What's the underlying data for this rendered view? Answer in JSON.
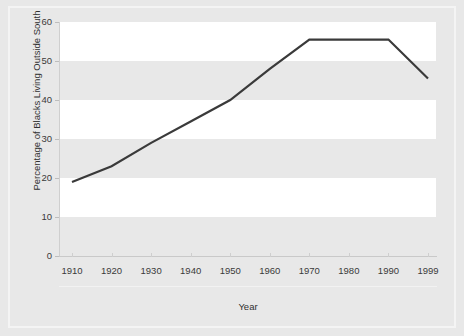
{
  "chart_data": {
    "type": "line",
    "title": "",
    "xlabel": "Year",
    "ylabel": "Percentage of Blacks Living Outside South",
    "categories": [
      "1910",
      "1920",
      "1930",
      "1940",
      "1950",
      "1960",
      "1970",
      "1980",
      "1990",
      "1999"
    ],
    "x": [
      1910,
      1920,
      1930,
      1940,
      1950,
      1960,
      1970,
      1980,
      1990,
      1999
    ],
    "values": [
      19,
      23,
      29,
      34.5,
      40,
      48,
      55.5,
      55.5,
      55.5,
      45.5
    ],
    "series": [
      {
        "name": "Percentage of Blacks Living Outside South",
        "values": [
          19,
          23,
          29,
          34.5,
          40,
          48,
          55.5,
          55.5,
          55.5,
          45.5
        ]
      }
    ],
    "ylim": [
      0,
      60
    ],
    "yticks": [
      0,
      10,
      20,
      30,
      40,
      50,
      60
    ],
    "ytick_labels": [
      "0",
      "10",
      "20",
      "30",
      "40",
      "50",
      "60"
    ],
    "xtick_labels": [
      "1910",
      "1920",
      "1930",
      "1940",
      "1950",
      "1960",
      "1970",
      "1980",
      "1990",
      "1999"
    ],
    "grid": false,
    "banded_background": true,
    "legend": null,
    "line_color": "#3a3a3a",
    "band_light_color": "#ffffff",
    "band_dark_color": "#e8e8e8",
    "plot_background": "#e8e8e8",
    "text_color": "#3a3a3a"
  }
}
